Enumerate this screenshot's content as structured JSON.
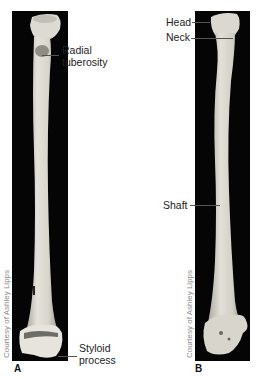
{
  "figure": {
    "panels": [
      {
        "id": "A",
        "letter": "A",
        "credit": "Courtesy of Ashley Lipps",
        "labels": [
          {
            "line1": "Radial",
            "line2": "tuberosity"
          },
          {
            "line1": "Styloid",
            "line2": "process"
          }
        ]
      },
      {
        "id": "B",
        "letter": "B",
        "credit": "Courtesy of Ashley Lipps",
        "labels": [
          {
            "text": "Head"
          },
          {
            "text": "Neck"
          },
          {
            "text": "Shaft"
          }
        ]
      }
    ],
    "colors": {
      "background": "#ffffff",
      "panel_bg": "#050505",
      "bone_light": "#e8e6df",
      "bone_mid": "#c9c6bd",
      "label_text": "#222222",
      "credit_text": "#8a8a8a"
    }
  }
}
